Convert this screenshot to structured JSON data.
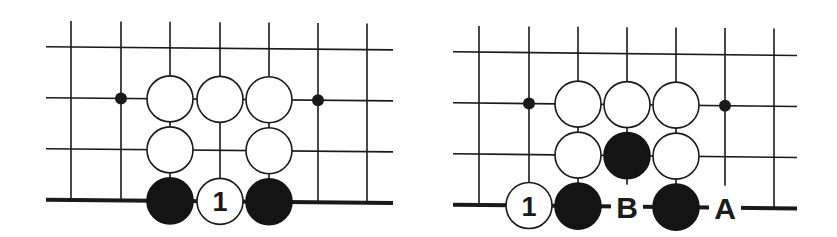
{
  "colors": {
    "background": "#ffffff",
    "ink": "#1a1a1a",
    "black_stone": "#141414",
    "white_stone": "#ffffff"
  },
  "diagrams": [
    {
      "id": "left",
      "grid": {
        "columns_x": [
          71,
          121,
          170,
          220,
          269,
          318,
          367
        ],
        "rows_y": [
          47,
          98,
          149
        ],
        "edge_y": 200,
        "line_left_x": 46,
        "line_right_x": 393,
        "line_top_y": 21,
        "slope": 0.009
      },
      "hoshi": [
        {
          "col": 1,
          "row": 1
        },
        {
          "col": 5,
          "row": 1
        }
      ],
      "stones": [
        {
          "color": "white",
          "col": 2,
          "row": 1
        },
        {
          "color": "white",
          "col": 3,
          "row": 1
        },
        {
          "color": "white",
          "col": 4,
          "row": 1
        },
        {
          "color": "white",
          "col": 2,
          "row": 2
        },
        {
          "color": "white",
          "col": 4,
          "row": 2
        },
        {
          "color": "black",
          "col": 2,
          "row": 3
        },
        {
          "color": "white",
          "col": 3,
          "row": 3,
          "number": "1"
        },
        {
          "color": "black",
          "col": 4,
          "row": 3
        }
      ],
      "labels": []
    },
    {
      "id": "right",
      "grid": {
        "columns_x": [
          479,
          529,
          578,
          627,
          676,
          725,
          774
        ],
        "rows_y": [
          52,
          103,
          154
        ],
        "edge_y": 205,
        "line_left_x": 453,
        "line_right_x": 797,
        "line_top_y": 26,
        "slope": 0.011
      },
      "hoshi": [
        {
          "col": 1,
          "row": 1
        },
        {
          "col": 5,
          "row": 1
        }
      ],
      "stones": [
        {
          "color": "white",
          "col": 2,
          "row": 1
        },
        {
          "color": "white",
          "col": 3,
          "row": 1
        },
        {
          "color": "white",
          "col": 4,
          "row": 1
        },
        {
          "color": "white",
          "col": 2,
          "row": 2
        },
        {
          "color": "black",
          "col": 3,
          "row": 2
        },
        {
          "color": "white",
          "col": 4,
          "row": 2
        },
        {
          "color": "white",
          "col": 1,
          "row": 3,
          "number": "1"
        },
        {
          "color": "black",
          "col": 2,
          "row": 3
        },
        {
          "color": "black",
          "col": 4,
          "row": 3
        }
      ],
      "labels": [
        {
          "text": "B",
          "col": 3,
          "row": 3
        },
        {
          "text": "A",
          "col": 5,
          "row": 3
        }
      ]
    }
  ],
  "stone_radius": 23,
  "hoshi_radius": 6
}
